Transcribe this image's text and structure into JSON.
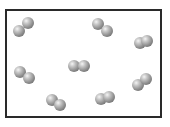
{
  "diagram": {
    "type": "particle-container",
    "container": {
      "x": 5,
      "y": 9,
      "width": 157,
      "height": 109,
      "border_color": "#2a2a2a"
    },
    "atom_radius": 6,
    "atom_color": "#9a9a9a",
    "molecules": [
      {
        "id": "molecule-1",
        "atoms": [
          [
            19,
            31
          ],
          [
            28,
            23
          ]
        ]
      },
      {
        "id": "molecule-2",
        "atoms": [
          [
            98,
            24
          ],
          [
            107,
            31
          ]
        ]
      },
      {
        "id": "molecule-3",
        "atoms": [
          [
            140,
            43
          ],
          [
            147,
            41
          ]
        ]
      },
      {
        "id": "molecule-4",
        "atoms": [
          [
            20,
            72
          ],
          [
            29,
            78
          ]
        ]
      },
      {
        "id": "molecule-5",
        "atoms": [
          [
            74,
            66
          ],
          [
            84,
            66
          ]
        ]
      },
      {
        "id": "molecule-6",
        "atoms": [
          [
            138,
            85
          ],
          [
            146,
            79
          ]
        ]
      },
      {
        "id": "molecule-7",
        "atoms": [
          [
            52,
            100
          ],
          [
            60,
            105
          ]
        ]
      },
      {
        "id": "molecule-8",
        "atoms": [
          [
            101,
            99
          ],
          [
            109,
            97
          ]
        ]
      }
    ]
  }
}
